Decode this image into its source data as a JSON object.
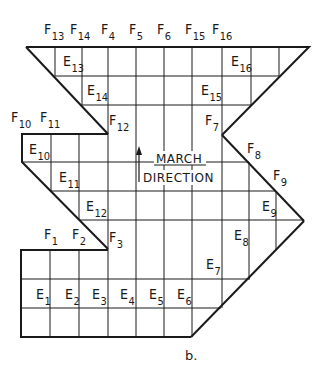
{
  "diagram": {
    "caption": "b.",
    "march_direction": {
      "line1": "MARCH",
      "line2": "DIRECTION"
    },
    "colors": {
      "stroke": "#1a1a1a",
      "background": "#ffffff"
    },
    "f_labels": [
      {
        "id": "F13",
        "letter": "F",
        "sub": "13",
        "x": 44,
        "y": 34
      },
      {
        "id": "F14",
        "letter": "F",
        "sub": "14",
        "x": 70,
        "y": 34
      },
      {
        "id": "F4",
        "letter": "F",
        "sub": "4",
        "x": 101,
        "y": 34
      },
      {
        "id": "F5",
        "letter": "F",
        "sub": "5",
        "x": 129,
        "y": 34
      },
      {
        "id": "F6",
        "letter": "F",
        "sub": "6",
        "x": 157,
        "y": 34
      },
      {
        "id": "F15",
        "letter": "F",
        "sub": "15",
        "x": 185,
        "y": 34
      },
      {
        "id": "F16",
        "letter": "F",
        "sub": "16",
        "x": 212,
        "y": 34
      },
      {
        "id": "F10",
        "letter": "F",
        "sub": "10",
        "x": 11,
        "y": 122
      },
      {
        "id": "F11",
        "letter": "F",
        "sub": "11",
        "x": 40,
        "y": 122
      },
      {
        "id": "F12",
        "letter": "F",
        "sub": "12",
        "x": 109,
        "y": 125
      },
      {
        "id": "F7",
        "letter": "F",
        "sub": "7",
        "x": 205,
        "y": 125
      },
      {
        "id": "F8",
        "letter": "F",
        "sub": "8",
        "x": 247,
        "y": 153
      },
      {
        "id": "F9",
        "letter": "F",
        "sub": "9",
        "x": 273,
        "y": 180
      },
      {
        "id": "F1",
        "letter": "F",
        "sub": "1",
        "x": 44,
        "y": 239
      },
      {
        "id": "F2",
        "letter": "F",
        "sub": "2",
        "x": 72,
        "y": 239
      },
      {
        "id": "F3",
        "letter": "F",
        "sub": "3",
        "x": 109,
        "y": 242
      }
    ],
    "e_labels": [
      {
        "id": "E13",
        "letter": "E",
        "sub": "13",
        "x": 63,
        "y": 66
      },
      {
        "id": "E16",
        "letter": "E",
        "sub": "16",
        "x": 231,
        "y": 66
      },
      {
        "id": "E14",
        "letter": "E",
        "sub": "14",
        "x": 87,
        "y": 95
      },
      {
        "id": "E15",
        "letter": "E",
        "sub": "15",
        "x": 201,
        "y": 95
      },
      {
        "id": "E10",
        "letter": "E",
        "sub": "10",
        "x": 29,
        "y": 154
      },
      {
        "id": "E11",
        "letter": "E",
        "sub": "11",
        "x": 59,
        "y": 182
      },
      {
        "id": "E12",
        "letter": "E",
        "sub": "12",
        "x": 86,
        "y": 211
      },
      {
        "id": "E9",
        "letter": "E",
        "sub": "9",
        "x": 262,
        "y": 211
      },
      {
        "id": "E8",
        "letter": "E",
        "sub": "8",
        "x": 234,
        "y": 240
      },
      {
        "id": "E7",
        "letter": "E",
        "sub": "7",
        "x": 206,
        "y": 269
      },
      {
        "id": "E1",
        "letter": "E",
        "sub": "1",
        "x": 36,
        "y": 299
      },
      {
        "id": "E2",
        "letter": "E",
        "sub": "2",
        "x": 65,
        "y": 299
      },
      {
        "id": "E3",
        "letter": "E",
        "sub": "3",
        "x": 92,
        "y": 299
      },
      {
        "id": "E4",
        "letter": "E",
        "sub": "4",
        "x": 120,
        "y": 299
      },
      {
        "id": "E5",
        "letter": "E",
        "sub": "5",
        "x": 149,
        "y": 299
      },
      {
        "id": "E6",
        "letter": "E",
        "sub": "6",
        "x": 177,
        "y": 299
      }
    ]
  }
}
